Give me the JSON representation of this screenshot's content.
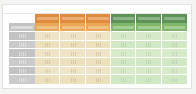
{
  "document": {
    "kind": "spreadsheet-table",
    "legibility": "illegible-blurred",
    "background_color": "#f4f4f2",
    "card_color": "#ffffff",
    "card_border_color": "#e2e2e0"
  },
  "palette": {
    "header_orange_dark": "#df8b3b",
    "header_orange_light": "#e9a855",
    "header_green_dark": "#5e9256",
    "header_green_light": "#80b86b",
    "stub_gray": "#c3c3c3",
    "stub_gray_alt": "#cbcbcb",
    "body_cream": "#efe4c6",
    "body_cream_alt": "#ece0bd",
    "body_green": "#d7ebcb",
    "body_green_alt": "#d1e8c4",
    "grid_line": "#ffffff"
  },
  "table": {
    "stub_header_top": "",
    "stub_header_sub": "",
    "group_headers": [
      {
        "label": "",
        "group": "orange",
        "span": 3
      },
      {
        "label": "",
        "group": "green",
        "span": 3
      }
    ],
    "column_headers": [
      {
        "label": "",
        "group": "orange"
      },
      {
        "label": "",
        "group": "orange"
      },
      {
        "label": "",
        "group": "orange"
      },
      {
        "label": "",
        "group": "green"
      },
      {
        "label": "",
        "group": "green"
      },
      {
        "label": "",
        "group": "green"
      }
    ],
    "rows": [
      {
        "label": "",
        "cells": [
          "",
          "",
          "",
          "",
          "",
          ""
        ]
      },
      {
        "label": "",
        "cells": [
          "",
          "",
          "",
          "",
          "",
          ""
        ]
      },
      {
        "label": "",
        "cells": [
          "",
          "",
          "",
          "",
          "",
          ""
        ]
      },
      {
        "label": "",
        "cells": [
          "",
          "",
          "",
          "",
          "",
          ""
        ]
      },
      {
        "label": "",
        "cells": [
          "",
          "",
          "",
          "",
          "",
          ""
        ]
      },
      {
        "label": "",
        "cells": [
          "",
          "",
          "",
          "",
          "",
          ""
        ]
      }
    ],
    "row_count": 6,
    "column_count": 6
  }
}
